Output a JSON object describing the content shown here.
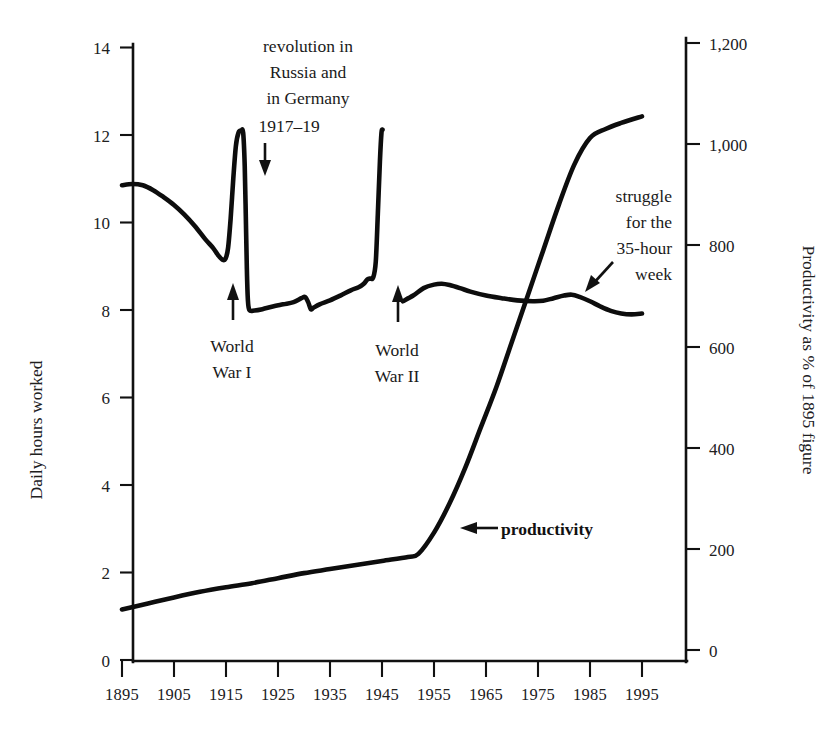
{
  "chart_data": {
    "type": "line",
    "title": "",
    "xlabel": "",
    "ylabel": "Daily hours worked",
    "y2label": "Productivity as % of 1895 figure",
    "xlim": [
      1893,
      1997
    ],
    "ylim": [
      0,
      14
    ],
    "y2lim": [
      0,
      1200
    ],
    "grid": false,
    "legend": "none",
    "xticks": [
      1895,
      1905,
      1915,
      1925,
      1935,
      1945,
      1955,
      1965,
      1975,
      1985,
      1995
    ],
    "xticklabels": [
      "1895",
      "1905",
      "1915",
      "1925",
      "1935",
      "1945",
      "1955",
      "1965",
      "1975",
      "1985",
      "1995"
    ],
    "yticks": [
      0,
      2,
      4,
      6,
      8,
      10,
      12,
      14
    ],
    "yticklabels": [
      "0",
      "2",
      "4",
      "6",
      "8",
      "10",
      "12",
      "14"
    ],
    "y2ticks": [
      0,
      200,
      400,
      600,
      800,
      1000,
      1200
    ],
    "y2ticklabels": [
      "0",
      "200",
      "400",
      "600",
      "800",
      "1,000",
      "1,200"
    ],
    "series": [
      {
        "name": "Daily hours worked",
        "axis": "left",
        "points": [
          [
            1895,
            10.85
          ],
          [
            1897,
            10.88
          ],
          [
            1899,
            10.85
          ],
          [
            1901,
            10.74
          ],
          [
            1903,
            10.58
          ],
          [
            1905,
            10.4
          ],
          [
            1907,
            10.18
          ],
          [
            1909,
            9.92
          ],
          [
            1911,
            9.62
          ],
          [
            1912.5,
            9.42
          ],
          [
            1913.5,
            9.25
          ],
          [
            1914.3,
            9.15
          ],
          [
            1914.9,
            9.17
          ],
          [
            1915.4,
            9.42
          ],
          [
            1915.9,
            10.1
          ],
          [
            1916.4,
            11.0
          ],
          [
            1916.9,
            11.75
          ],
          [
            1917.4,
            12.05
          ],
          [
            1917.9,
            12.1
          ],
          [
            1918.3,
            12.05
          ],
          [
            1918.6,
            11.3
          ],
          [
            1918.8,
            10.2
          ],
          [
            1919.0,
            9.0
          ],
          [
            1919.2,
            8.25
          ],
          [
            1919.5,
            8.0
          ],
          [
            1920.5,
            7.99
          ],
          [
            1922,
            8.02
          ],
          [
            1924,
            8.08
          ],
          [
            1926,
            8.13
          ],
          [
            1928,
            8.18
          ],
          [
            1929.5,
            8.27
          ],
          [
            1930.2,
            8.3
          ],
          [
            1930.8,
            8.18
          ],
          [
            1931.3,
            8.02
          ],
          [
            1931.8,
            8.05
          ],
          [
            1933,
            8.13
          ],
          [
            1935,
            8.22
          ],
          [
            1937,
            8.33
          ],
          [
            1939,
            8.45
          ],
          [
            1940.5,
            8.52
          ],
          [
            1941.5,
            8.6
          ],
          [
            1942.2,
            8.7
          ],
          [
            1942.8,
            8.72
          ],
          [
            1943.3,
            8.74
          ],
          [
            1943.8,
            9.1
          ],
          [
            1944.2,
            10.2
          ],
          [
            1944.6,
            11.4
          ],
          [
            1944.9,
            12.05
          ],
          [
            1945.1,
            12.12
          ]
        ]
      },
      {
        "name": "Daily hours worked (postwar)",
        "axis": "left",
        "points": [
          [
            1949,
            8.2
          ],
          [
            1951,
            8.33
          ],
          [
            1953,
            8.5
          ],
          [
            1955,
            8.58
          ],
          [
            1956.5,
            8.6
          ],
          [
            1958,
            8.57
          ],
          [
            1960,
            8.5
          ],
          [
            1962,
            8.42
          ],
          [
            1965,
            8.33
          ],
          [
            1968,
            8.27
          ],
          [
            1971,
            8.22
          ],
          [
            1974,
            8.2
          ],
          [
            1976,
            8.21
          ],
          [
            1978,
            8.27
          ],
          [
            1980,
            8.33
          ],
          [
            1981.5,
            8.35
          ],
          [
            1983,
            8.3
          ],
          [
            1985,
            8.2
          ],
          [
            1987,
            8.08
          ],
          [
            1989,
            7.98
          ],
          [
            1991,
            7.92
          ],
          [
            1993,
            7.9
          ],
          [
            1995,
            7.92
          ]
        ]
      },
      {
        "name": "Productivity",
        "axis": "right",
        "points": [
          [
            1895,
            80
          ],
          [
            1900,
            92
          ],
          [
            1905,
            104
          ],
          [
            1910,
            115
          ],
          [
            1915,
            124
          ],
          [
            1920,
            132
          ],
          [
            1925,
            142
          ],
          [
            1930,
            152
          ],
          [
            1935,
            160
          ],
          [
            1940,
            168
          ],
          [
            1945,
            176
          ],
          [
            1950,
            184
          ],
          [
            1952,
            190
          ],
          [
            1955,
            232
          ],
          [
            1958,
            290
          ],
          [
            1961,
            360
          ],
          [
            1964,
            440
          ],
          [
            1967,
            520
          ],
          [
            1970,
            610
          ],
          [
            1973,
            700
          ],
          [
            1976,
            790
          ],
          [
            1979,
            880
          ],
          [
            1982,
            960
          ],
          [
            1985,
            1012
          ],
          [
            1988,
            1030
          ],
          [
            1991,
            1042
          ],
          [
            1995,
            1055
          ]
        ]
      }
    ],
    "annotations": [
      {
        "id": "revolution",
        "lines": [
          "revolution in",
          "Russia and",
          "in Germany",
          "1917–19"
        ],
        "arrow": "down"
      },
      {
        "id": "world-war-i",
        "lines": [
          "World",
          "War I"
        ],
        "arrow": "up"
      },
      {
        "id": "world-war-ii",
        "lines": [
          "World",
          "War II"
        ],
        "arrow": "up"
      },
      {
        "id": "struggle",
        "lines": [
          "struggle",
          "for the",
          "35-hour",
          "week"
        ],
        "arrow": "down-left"
      },
      {
        "id": "productivity",
        "lines": [
          "productivity"
        ],
        "arrow": "left"
      }
    ]
  },
  "axes": {
    "left_title": "Daily hours worked",
    "right_title": "Productivity as % of 1895 figure"
  },
  "annotations": {
    "revolution": {
      "l1": "revolution in",
      "l2": "Russia and",
      "l3": "in Germany",
      "l4": "1917–19"
    },
    "ww1": {
      "l1": "World",
      "l2": "War I"
    },
    "ww2": {
      "l1": "World",
      "l2": "War II"
    },
    "struggle": {
      "l1": "struggle",
      "l2": "for the",
      "l3": "35-hour",
      "l4": "week"
    },
    "productivity": {
      "label": "productivity"
    }
  },
  "colors": {
    "ink": "#111111",
    "paper": "#ffffff"
  }
}
